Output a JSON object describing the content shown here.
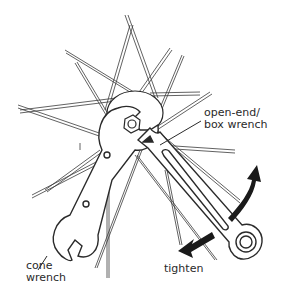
{
  "diagram": {
    "labels": {
      "open_end_box_wrench": [
        "open-end/",
        "box wrench"
      ],
      "cone_wrench": [
        "cone",
        "wrench"
      ],
      "tighten": "tighten"
    },
    "colors": {
      "line": "#2a2a2a",
      "background": "#ffffff"
    }
  }
}
